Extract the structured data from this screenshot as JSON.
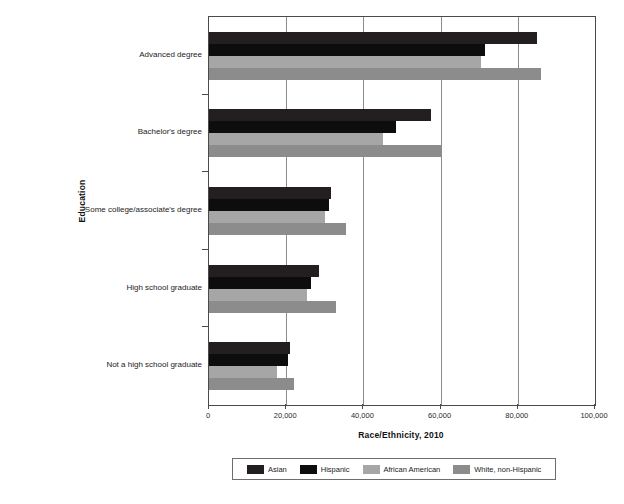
{
  "chart_data": {
    "type": "bar",
    "orientation": "horizontal",
    "title": "",
    "xlabel": "Race/Ethnicity, 2010",
    "ylabel": "Education",
    "xlim": [
      0,
      100000
    ],
    "grid": true,
    "legend_position": "bottom",
    "categories": [
      "Advanced degree",
      "Bachelor's degree",
      "Some college/associate's degree",
      "High school graduate",
      "Not a high school graduate"
    ],
    "xticks": [
      0,
      20000,
      40000,
      60000,
      80000,
      100000
    ],
    "xticklabels": [
      "0",
      "20,000",
      "40,000",
      "60,000",
      "80,000",
      "100,000"
    ],
    "series": [
      {
        "name": "Asian",
        "color": "#231f20",
        "values": [
          85000,
          57500,
          31500,
          28500,
          21000
        ]
      },
      {
        "name": "Hispanic",
        "color": "#0d0d0d",
        "values": [
          71500,
          48500,
          31000,
          26500,
          20500
        ]
      },
      {
        "name": "African American",
        "color": "#a6a6a6",
        "values": [
          70500,
          45000,
          30000,
          25500,
          17500
        ]
      },
      {
        "name": "White, non-Hispanic",
        "color": "#8c8c8c",
        "values": [
          86000,
          60000,
          35500,
          33000,
          22000
        ]
      }
    ]
  },
  "colors": {
    "axis": "#4a4a4a",
    "gridline": "#8c8c8c",
    "background": "#ffffff",
    "text": "#1a1a1a"
  }
}
